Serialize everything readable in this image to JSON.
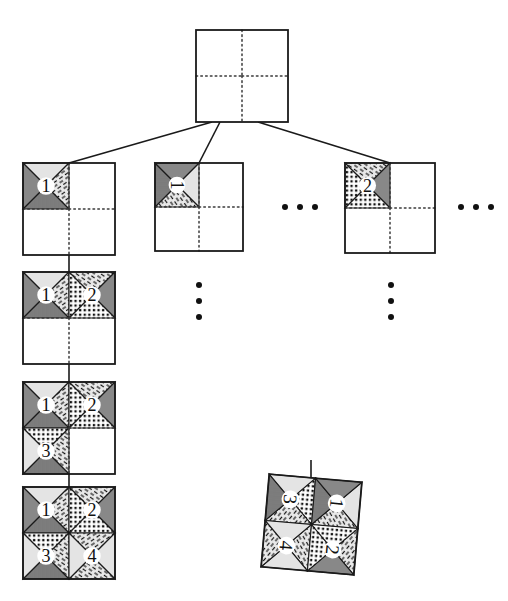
{
  "figure": {
    "title": "Recursive quadrant subdivision tree",
    "background_color": "#ffffff",
    "line_color": "#1a1a1a",
    "dotted_color": "#3a3a3a",
    "tile_fill": "#e2e2e2"
  },
  "root": {
    "name": "root-square",
    "label": "",
    "x": 196,
    "y": 30,
    "size": 92,
    "quadrants": [
      {
        "index": 1,
        "label": "",
        "filled": false,
        "motif": "empty"
      },
      {
        "index": 2,
        "label": "",
        "filled": false,
        "motif": "empty"
      },
      {
        "index": 3,
        "label": "",
        "filled": false,
        "motif": "empty"
      },
      {
        "index": 4,
        "label": "",
        "filled": false,
        "motif": "empty"
      }
    ]
  },
  "level2": [
    {
      "name": "child-square-1",
      "x": 23,
      "y": 163,
      "size": 92,
      "rotation": 0,
      "quadrants": [
        {
          "index": 1,
          "label": "1",
          "filled": true,
          "motif": "tile-1",
          "rotation": 0
        },
        {
          "index": 2,
          "label": "",
          "filled": false,
          "motif": "empty"
        },
        {
          "index": 3,
          "label": "",
          "filled": false,
          "motif": "empty"
        },
        {
          "index": 4,
          "label": "",
          "filled": false,
          "motif": "empty"
        }
      ]
    },
    {
      "name": "child-square-2",
      "x": 155,
      "y": 163,
      "size": 88,
      "rotation": 0,
      "quadrants": [
        {
          "index": 1,
          "label": "1",
          "filled": true,
          "motif": "tile-1",
          "rotation": 90
        },
        {
          "index": 2,
          "label": "",
          "filled": false,
          "motif": "empty"
        },
        {
          "index": 3,
          "label": "",
          "filled": false,
          "motif": "empty"
        },
        {
          "index": 4,
          "label": "",
          "filled": false,
          "motif": "empty"
        }
      ]
    },
    {
      "name": "child-square-3",
      "x": 345,
      "y": 163,
      "size": 90,
      "rotation": 0,
      "quadrants": [
        {
          "index": 1,
          "label": "2",
          "filled": true,
          "motif": "tile-2",
          "rotation": 0
        },
        {
          "index": 2,
          "label": "",
          "filled": false,
          "motif": "empty"
        },
        {
          "index": 3,
          "label": "",
          "filled": false,
          "motif": "empty"
        },
        {
          "index": 4,
          "label": "",
          "filled": false,
          "motif": "empty"
        }
      ]
    }
  ],
  "chain": [
    {
      "name": "chain-square-1",
      "x": 23,
      "y": 272,
      "size": 92,
      "quadrants": [
        {
          "index": 1,
          "label": "1",
          "filled": true,
          "motif": "tile-1"
        },
        {
          "index": 2,
          "label": "2",
          "filled": true,
          "motif": "tile-2"
        },
        {
          "index": 3,
          "label": "",
          "filled": false,
          "motif": "empty"
        },
        {
          "index": 4,
          "label": "",
          "filled": false,
          "motif": "empty"
        }
      ]
    },
    {
      "name": "chain-square-2",
      "x": 23,
      "y": 382,
      "size": 92,
      "quadrants": [
        {
          "index": 1,
          "label": "1",
          "filled": true,
          "motif": "tile-1"
        },
        {
          "index": 2,
          "label": "2",
          "filled": true,
          "motif": "tile-2"
        },
        {
          "index": 3,
          "label": "3",
          "filled": true,
          "motif": "tile-3"
        },
        {
          "index": 4,
          "label": "",
          "filled": false,
          "motif": "empty"
        }
      ]
    },
    {
      "name": "chain-square-3",
      "x": 23,
      "y": 487,
      "size": 92,
      "quadrants": [
        {
          "index": 1,
          "label": "1",
          "filled": true,
          "motif": "tile-1"
        },
        {
          "index": 2,
          "label": "2",
          "filled": true,
          "motif": "tile-2"
        },
        {
          "index": 3,
          "label": "3",
          "filled": true,
          "motif": "tile-3"
        },
        {
          "index": 4,
          "label": "4",
          "filled": true,
          "motif": "tile-4"
        }
      ]
    }
  ],
  "rotated_result": {
    "name": "rotated-result-square",
    "x": 265,
    "y": 478,
    "size": 93,
    "rotation": 95,
    "quadrants": [
      {
        "index": 3,
        "label": "3",
        "filled": true,
        "motif": "tile-3"
      },
      {
        "index": 1,
        "label": "1",
        "filled": true,
        "motif": "tile-1"
      },
      {
        "index": 4,
        "label": "4",
        "filled": true,
        "motif": "tile-4"
      },
      {
        "index": 2,
        "label": "2",
        "filled": true,
        "motif": "tile-2"
      }
    ]
  },
  "ellipses": [
    {
      "name": "ellipsis-horizontal-middle",
      "orientation": "horizontal",
      "x": 282,
      "y": 204,
      "dots": 3
    },
    {
      "name": "ellipsis-horizontal-right",
      "orientation": "horizontal",
      "x": 458,
      "y": 204,
      "dots": 3
    },
    {
      "name": "ellipsis-vertical-left",
      "orientation": "vertical",
      "x": 196,
      "y": 282,
      "dots": 3
    },
    {
      "name": "ellipsis-vertical-right",
      "orientation": "vertical",
      "x": 388,
      "y": 282,
      "dots": 3
    }
  ],
  "edges": [
    {
      "name": "edge-root-to-child-1",
      "from": "root-square",
      "to": "child-square-1",
      "x1": 212,
      "y1": 122,
      "x2": 69,
      "y2": 163
    },
    {
      "name": "edge-root-to-child-2",
      "from": "root-square",
      "to": "child-square-2",
      "x1": 220,
      "y1": 122,
      "x2": 199,
      "y2": 163
    },
    {
      "name": "edge-root-to-child-3",
      "from": "root-square",
      "to": "child-square-3",
      "x1": 258,
      "y1": 122,
      "x2": 390,
      "y2": 163
    },
    {
      "name": "edge-chain-1",
      "from": "child-square-1",
      "to": "chain-square-1",
      "x1": 69,
      "y1": 255,
      "x2": 69,
      "y2": 272
    },
    {
      "name": "edge-chain-2",
      "from": "chain-square-1",
      "to": "chain-square-2",
      "x1": 69,
      "y1": 364,
      "x2": 69,
      "y2": 382
    },
    {
      "name": "edge-chain-3",
      "from": "chain-square-2",
      "to": "chain-square-3",
      "x1": 69,
      "y1": 474,
      "x2": 69,
      "y2": 487
    },
    {
      "name": "edge-rotated-stem",
      "from": "rotated-result-square",
      "to": "rotated-result-square",
      "x1": 311,
      "y1": 460,
      "x2": 311,
      "y2": 500
    }
  ]
}
